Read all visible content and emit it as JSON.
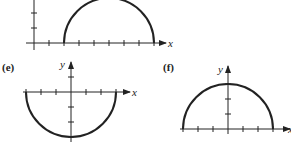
{
  "panels": [
    {
      "id": "top",
      "label": "",
      "x_axis_label": "x",
      "y_axis_label": "",
      "curve": "upper semicircle",
      "center": [
        5,
        0
      ],
      "radius": 3,
      "x_ticks": [
        1,
        2,
        3,
        4,
        5,
        6,
        7,
        8
      ],
      "y_ticks": [
        1,
        2
      ]
    },
    {
      "id": "e",
      "label": "(e)",
      "x_axis_label": "x",
      "y_axis_label": "y",
      "curve": "lower semicircle",
      "center": [
        0,
        0
      ],
      "radius": 3,
      "x_ticks": [
        -3,
        -2,
        -1,
        1,
        2,
        3
      ],
      "y_ticks": [
        1,
        -1,
        -2,
        -3
      ]
    },
    {
      "id": "f",
      "label": "(f)",
      "x_axis_label": "x",
      "y_axis_label": "y",
      "curve": "upper semicircle",
      "center": [
        0,
        0
      ],
      "radius": 3,
      "x_ticks": [
        -3,
        -2,
        -1,
        1,
        2,
        3
      ],
      "y_ticks": [
        1,
        2,
        3
      ]
    }
  ],
  "colors": {
    "ink": "#222222",
    "background": "#ffffff"
  }
}
